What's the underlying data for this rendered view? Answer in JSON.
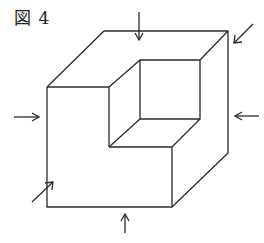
{
  "figure": {
    "label": "図 4"
  },
  "diagram": {
    "type": "isometric solid: cube with corner notch removed",
    "colors": {
      "line": "#2a2a2a",
      "background": "#ffffff"
    },
    "view_arrows": [
      {
        "id": "top",
        "direction": "down"
      },
      {
        "id": "back-right",
        "direction": "down-left"
      },
      {
        "id": "left",
        "direction": "right"
      },
      {
        "id": "right",
        "direction": "left"
      },
      {
        "id": "front-left",
        "direction": "up-right"
      },
      {
        "id": "bottom",
        "direction": "up"
      }
    ]
  }
}
